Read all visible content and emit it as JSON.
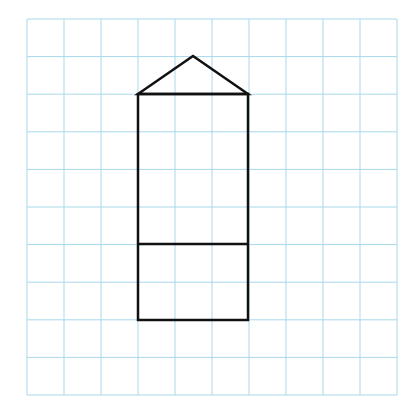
{
  "diagram": {
    "type": "grid-drawing",
    "grid": {
      "columns": 10,
      "rows": 10,
      "line_color": "#a8d8ea"
    },
    "shape": {
      "description": "Rectangle 3 cells wide by 6 cells tall with a triangular roof and a horizontal dividing line 2 cells from the bottom",
      "stroke_color": "#111111",
      "rectangle": {
        "col_start": 3,
        "col_end": 6,
        "row_start": 2,
        "row_end": 8
      },
      "divider_row": 6,
      "roof_apex": {
        "col": 4.5,
        "row": 1
      }
    }
  }
}
